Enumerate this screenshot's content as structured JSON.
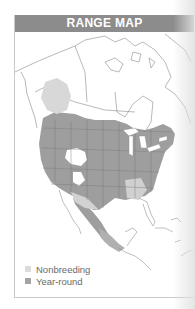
{
  "header": {
    "title": "RANGE MAP"
  },
  "map": {
    "region": "North America",
    "colors": {
      "year_round": "#9e9e9e",
      "nonbreeding": "#d6d6d6",
      "outline": "#8a8a8a",
      "header": "#8c8c8c"
    }
  },
  "legend": {
    "items": [
      {
        "label": "Nonbreeding",
        "color": "#dcdcdc"
      },
      {
        "label": "Year-round",
        "color": "#a3a3a3"
      }
    ]
  }
}
